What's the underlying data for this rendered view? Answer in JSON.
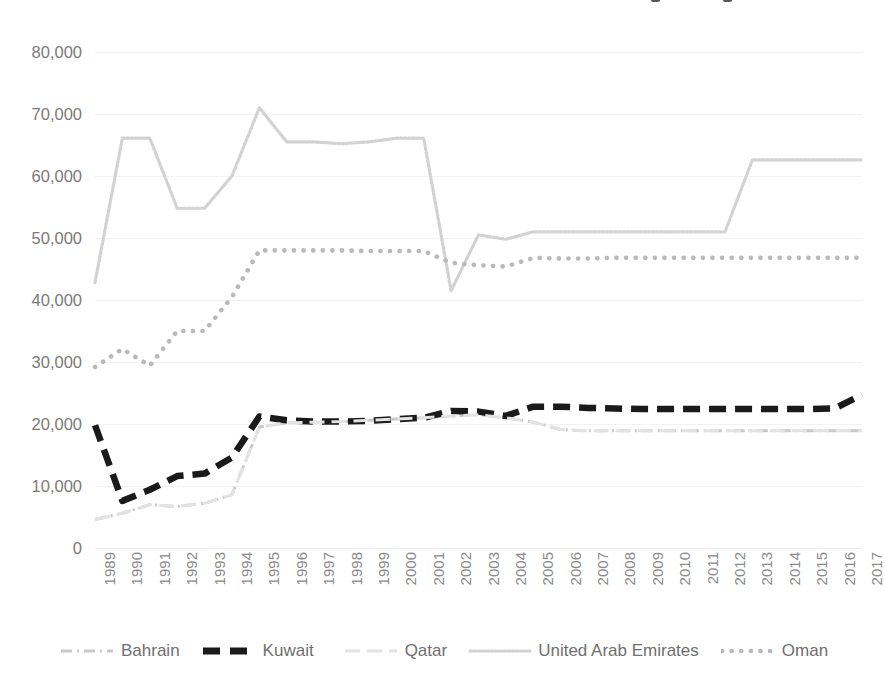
{
  "chart_data": {
    "type": "line",
    "title": "",
    "subtitle": "",
    "xlabel": "",
    "ylabel": "",
    "grid": true,
    "legend_position": "bottom",
    "ylim": [
      0,
      80000
    ],
    "ytick_step": 10000,
    "ytick_labels": [
      "0",
      "10,000",
      "20,000",
      "30,000",
      "40,000",
      "50,000",
      "60,000",
      "70,000",
      "80,000"
    ],
    "categories": [
      "1989",
      "1990",
      "1991",
      "1992",
      "1993",
      "1994",
      "1995",
      "1996",
      "1997",
      "1998",
      "1999",
      "2000",
      "2001",
      "2002",
      "2003",
      "2004",
      "2005",
      "2006",
      "2007",
      "2008",
      "2009",
      "2010",
      "2011",
      "2012",
      "2013",
      "2014",
      "2015",
      "2016",
      "2017"
    ],
    "series": [
      {
        "name": "Bahrain",
        "color": "#c9c9c9",
        "style": "dash-dot",
        "values": [
          4600,
          5600,
          7000,
          6700,
          7200,
          8600,
          19500,
          20200,
          20300,
          20400,
          20600,
          20800,
          21000,
          21300,
          21500,
          21000,
          20300,
          19100,
          18900,
          18900,
          18900,
          18900,
          18900,
          18900,
          18900,
          18900,
          18900,
          18900,
          18900
        ]
      },
      {
        "name": "Kuwait",
        "color": "#1a1a1a",
        "style": "thick-dash",
        "values": [
          19800,
          7600,
          9400,
          11600,
          12000,
          14600,
          21200,
          20600,
          20400,
          20400,
          20500,
          20800,
          21000,
          22100,
          22000,
          21300,
          22800,
          22800,
          22600,
          22500,
          22400,
          22400,
          22400,
          22400,
          22400,
          22400,
          22400,
          22500,
          24700
        ]
      },
      {
        "name": "Qatar",
        "color": "#e2e2e2",
        "style": "long-dash",
        "values": [
          4600,
          5600,
          7000,
          6700,
          7200,
          8600,
          19500,
          20200,
          20300,
          20400,
          20600,
          20800,
          21000,
          21300,
          21500,
          21000,
          20300,
          19100,
          18900,
          18900,
          18900,
          18900,
          18900,
          18900,
          18900,
          18900,
          18900,
          18900,
          18900
        ]
      },
      {
        "name": "United Arab Emirates",
        "color": "#d2d2d2",
        "style": "fine-dot",
        "values": [
          42800,
          66100,
          66100,
          54800,
          54800,
          60000,
          71000,
          65500,
          65500,
          65200,
          65500,
          66100,
          66100,
          41500,
          50500,
          49800,
          51000,
          51000,
          51000,
          51000,
          51000,
          51000,
          51000,
          51000,
          62600,
          62600,
          62600,
          62600,
          62600
        ]
      },
      {
        "name": "Oman",
        "color": "#b9b9b9",
        "style": "round-dot",
        "values": [
          29200,
          32100,
          29400,
          35000,
          35000,
          40500,
          48000,
          48000,
          48000,
          48000,
          47900,
          47900,
          47900,
          46000,
          45600,
          45400,
          46800,
          46700,
          46700,
          46800,
          46800,
          46800,
          46800,
          46800,
          46800,
          46800,
          46800,
          46800,
          46800
        ]
      }
    ]
  },
  "legend": {
    "items": [
      {
        "label": "Bahrain",
        "icon": "dash-dot-line-swatch"
      },
      {
        "label": "Kuwait",
        "icon": "thick-dash-line-swatch"
      },
      {
        "label": "Qatar",
        "icon": "long-dash-line-swatch"
      },
      {
        "label": "United Arab Emirates",
        "icon": "fine-dot-line-swatch"
      },
      {
        "label": "Oman",
        "icon": "round-dot-line-swatch"
      }
    ]
  }
}
